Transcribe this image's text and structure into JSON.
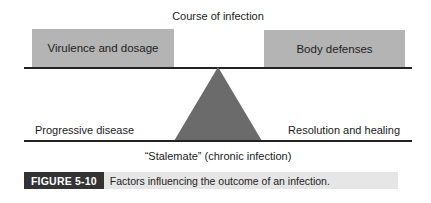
{
  "diagram": {
    "title": "Course of infection",
    "left_weight": "Virulence and dosage",
    "right_weight": "Body defenses",
    "left_outcome": "Progressive disease",
    "right_outcome": "Resolution and healing",
    "center_outcome": "“Stalemate” (chronic infection)",
    "colors": {
      "weight_box": "#b4b4b4",
      "fulcrum": "#6b6b6b",
      "lines": "#222222",
      "caption_label_bg": "#333333",
      "caption_bg": "#e6e6e6"
    }
  },
  "caption": {
    "label": "FIGURE 5-10",
    "text": "Factors influencing the outcome of an infection."
  }
}
